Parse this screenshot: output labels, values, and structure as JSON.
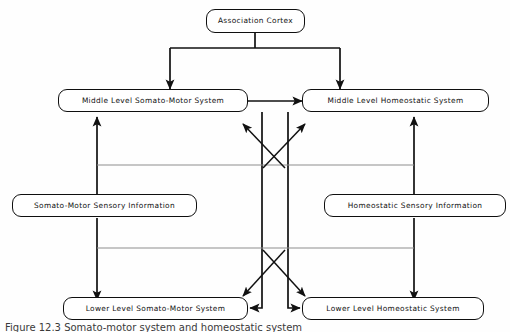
{
  "figure": {
    "caption": "Figure 12.3  Somato-motor system and homeostatic system",
    "background_color": "#fefefe",
    "line_color": "#111111",
    "faint_line_color": "#8d8d8d",
    "text_color": "#101010"
  },
  "nodes": [
    {
      "id": "association-cortex",
      "label": "Association Cortex",
      "level": "top"
    },
    {
      "id": "middle-somato-motor",
      "label": "Middle Level Somato-Motor System",
      "level": "middle"
    },
    {
      "id": "middle-homeostatic",
      "label": "Middle Level Homeostatic System",
      "level": "middle"
    },
    {
      "id": "somato-motor-sensory",
      "label": "Somato-Motor Sensory Information",
      "level": "sensory"
    },
    {
      "id": "homeostatic-sensory",
      "label": "Homeostatic Sensory Information",
      "level": "sensory"
    },
    {
      "id": "lower-somato-motor",
      "label": "Lower Level Somato-Motor System",
      "level": "lower"
    },
    {
      "id": "lower-homeostatic",
      "label": "Lower Level Homeostatic System",
      "level": "lower"
    }
  ],
  "edges": [
    {
      "id": "cortex-to-middle-somato-motor",
      "from": "association-cortex",
      "to": "middle-somato-motor",
      "style": "solid",
      "arrow": "single"
    },
    {
      "id": "cortex-to-middle-homeostatic",
      "from": "association-cortex",
      "to": "middle-homeostatic",
      "style": "solid",
      "arrow": "single"
    },
    {
      "id": "middle-somato-motor-to-middle-homeostatic",
      "from": "middle-somato-motor",
      "to": "middle-homeostatic",
      "style": "solid",
      "arrow": "double"
    },
    {
      "id": "sensory-somato-motor-to-middle",
      "from": "somato-motor-sensory",
      "to": "middle-somato-motor",
      "style": "solid",
      "arrow": "single"
    },
    {
      "id": "sensory-homeostatic-to-middle",
      "from": "homeostatic-sensory",
      "to": "middle-homeostatic",
      "style": "solid",
      "arrow": "single"
    },
    {
      "id": "middle-somato-motor-to-lower-somato-motor",
      "from": "middle-somato-motor",
      "to": "lower-somato-motor",
      "style": "solid",
      "arrow": "single"
    },
    {
      "id": "middle-homeostatic-to-lower-homeostatic",
      "from": "middle-homeostatic",
      "to": "lower-homeostatic",
      "style": "solid",
      "arrow": "single"
    },
    {
      "id": "cross-lower-homeostatic-to-middle-somato-motor",
      "from": "lower-homeostatic",
      "to": "middle-somato-motor",
      "style": "solid",
      "arrow": "single"
    },
    {
      "id": "cross-lower-somato-motor-to-middle-homeostatic",
      "from": "lower-somato-motor",
      "to": "middle-homeostatic",
      "style": "solid",
      "arrow": "single"
    },
    {
      "id": "cross-middle-homeostatic-to-lower-somato-motor",
      "from": "middle-homeostatic",
      "to": "lower-somato-motor",
      "style": "solid",
      "arrow": "single"
    },
    {
      "id": "cross-middle-somato-motor-to-lower-homeostatic",
      "from": "middle-somato-motor",
      "to": "lower-homeostatic",
      "style": "solid",
      "arrow": "single"
    }
  ]
}
